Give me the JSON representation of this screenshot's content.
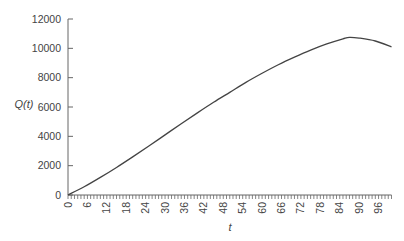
{
  "chart_data": {
    "type": "line",
    "title": "",
    "xlabel": "t",
    "ylabel": "Q(t)",
    "xlim": [
      0,
      100
    ],
    "ylim": [
      0,
      12000
    ],
    "grid": false,
    "legend": null,
    "x_ticks": [
      0,
      6,
      12,
      18,
      24,
      30,
      36,
      42,
      48,
      54,
      60,
      66,
      72,
      78,
      84,
      90,
      96
    ],
    "x_minor_tick_step": 1,
    "y_ticks": [
      0,
      2000,
      4000,
      6000,
      8000,
      10000,
      12000
    ],
    "series": [
      {
        "name": "Q(t)",
        "color": "#444444",
        "x": [
          0,
          5,
          10,
          15,
          20,
          25,
          30,
          35,
          40,
          45,
          50,
          55,
          60,
          65,
          70,
          75,
          80,
          85,
          87,
          90,
          95,
          100
        ],
        "y": [
          0,
          560,
          1200,
          1880,
          2600,
          3340,
          4100,
          4860,
          5600,
          6320,
          7000,
          7680,
          8300,
          8880,
          9400,
          9880,
          10300,
          10650,
          10750,
          10700,
          10500,
          10100
        ]
      }
    ]
  }
}
